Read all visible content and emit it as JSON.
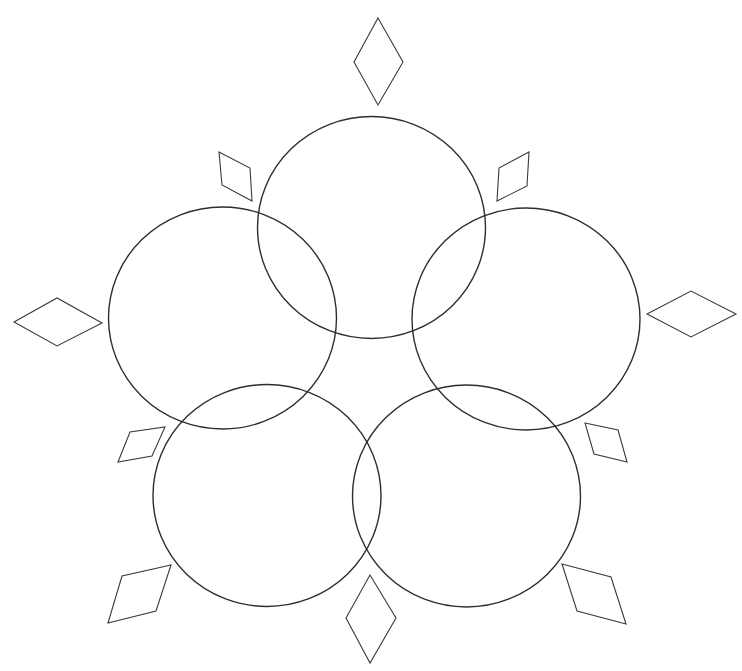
{
  "diagram": {
    "type": "five-ring-flower",
    "background": "#ffffff",
    "colors": {
      "ring_stroke": "#2e2e2e",
      "petal_stroke": "#3a3a3a"
    },
    "rings": [
      {
        "name": "ring-top",
        "cx": 371.5,
        "cy": 227.5,
        "rx": 114,
        "ry": 111
      },
      {
        "name": "ring-left",
        "cx": 222.5,
        "cy": 318,
        "rx": 114,
        "ry": 111
      },
      {
        "name": "ring-right",
        "cx": 526,
        "cy": 319,
        "rx": 114,
        "ry": 111
      },
      {
        "name": "ring-bottom-left",
        "cx": 267,
        "cy": 495.5,
        "rx": 114,
        "ry": 111
      },
      {
        "name": "ring-bottom-right",
        "cx": 466.5,
        "cy": 496,
        "rx": 114,
        "ry": 111
      }
    ],
    "diamonds": [
      {
        "name": "diamond-top",
        "points": "378,18 403,62 378,105 354,62"
      },
      {
        "name": "diamond-upper-left",
        "points": "219,152 250,168 252,201 222,185"
      },
      {
        "name": "diamond-upper-right",
        "points": "529,152 527,186 497,201 499,168"
      },
      {
        "name": "diamond-left",
        "points": "14,322 57,298 102,323 57,346"
      },
      {
        "name": "diamond-right",
        "points": "647,314 691,291 736,314 691,337"
      },
      {
        "name": "diamond-lower-left",
        "points": "118,462 130,432 165,427 152,456"
      },
      {
        "name": "diamond-lower-right",
        "points": "585,423 618,430 627,462 594,454"
      },
      {
        "name": "diamond-bottom-left",
        "points": "108,623 122,576 171,565 156,611"
      },
      {
        "name": "diamond-bottom-right",
        "points": "562,564 611,577 626,624 577,611"
      },
      {
        "name": "diamond-bottom",
        "points": "370,575 396,618 370,663 346,618"
      }
    ]
  }
}
